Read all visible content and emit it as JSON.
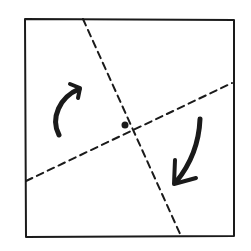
{
  "diagram": {
    "canvas": {
      "width": 251,
      "height": 251,
      "background": "#ffffff"
    },
    "colors": {
      "ink": "#1a1a1a"
    },
    "square": {
      "corners": [
        [
          25,
          19
        ],
        [
          234,
          20
        ],
        [
          234,
          236
        ],
        [
          26,
          237
        ]
      ],
      "stroke_width": 2
    },
    "dashed_lines": [
      {
        "name": "steep-axis",
        "from": [
          83,
          19
        ],
        "to": [
          181,
          236
        ]
      },
      {
        "name": "shallow-axis",
        "from": [
          26,
          181
        ],
        "to": [
          232,
          83
        ]
      }
    ],
    "center_point": {
      "x": 125,
      "y": 125,
      "r": 3.5
    },
    "arrows": [
      {
        "name": "rotation-arrow-upper-left",
        "direction": "clockwise, pointing up-right",
        "path": "M59 135 C 50 118, 60 97, 79 89"
      },
      {
        "name": "rotation-arrow-lower-right",
        "direction": "clockwise, pointing down-left",
        "path": "M200 119 C 199 144, 190 165, 176 182"
      }
    ]
  }
}
